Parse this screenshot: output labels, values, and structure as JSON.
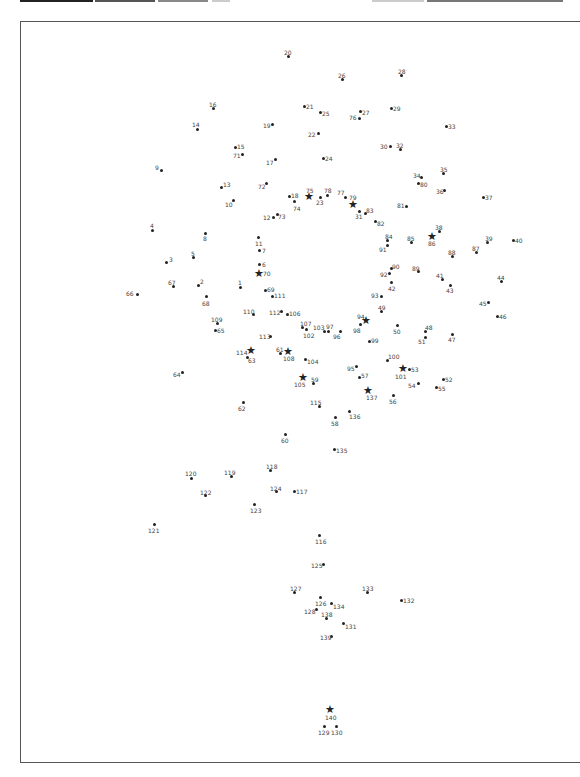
{
  "topbar": {
    "segments": [
      {
        "x": 20,
        "w": 73,
        "color": "#222222"
      },
      {
        "x": 95,
        "w": 60,
        "color": "#555555"
      },
      {
        "x": 158,
        "w": 50,
        "color": "#888888"
      },
      {
        "x": 212,
        "w": 18,
        "color": "#cccccc"
      },
      {
        "x": 372,
        "w": 52,
        "color": "#cccccc"
      },
      {
        "x": 427,
        "w": 136,
        "color": "#777777"
      }
    ]
  },
  "puzzle": {
    "type": "dot-to-dot",
    "points": [
      {
        "n": "1",
        "x": 240,
        "y": 287,
        "lx": 238,
        "ly": 279
      },
      {
        "n": "2",
        "x": 198,
        "y": 285,
        "lx": 200,
        "ly": 278
      },
      {
        "n": "3",
        "x": 166,
        "y": 262,
        "lx": 169,
        "ly": 256
      },
      {
        "n": "4",
        "x": 152,
        "y": 230,
        "lx": 150,
        "ly": 222
      },
      {
        "n": "5",
        "x": 193,
        "y": 257,
        "lx": 191,
        "ly": 250
      },
      {
        "n": "6",
        "x": 259,
        "y": 264,
        "lx": 262,
        "ly": 261
      },
      {
        "n": "7",
        "x": 259,
        "y": 250,
        "lx": 262,
        "ly": 247
      },
      {
        "n": "8",
        "x": 205,
        "y": 233,
        "lx": 203,
        "ly": 235
      },
      {
        "n": "9",
        "x": 161,
        "y": 170,
        "lx": 155,
        "ly": 164
      },
      {
        "n": "10",
        "x": 233,
        "y": 200,
        "lx": 225,
        "ly": 201
      },
      {
        "n": "11",
        "x": 258,
        "y": 237,
        "lx": 255,
        "ly": 240
      },
      {
        "n": "12",
        "x": 273,
        "y": 217,
        "lx": 263,
        "ly": 214
      },
      {
        "n": "13",
        "x": 221,
        "y": 187,
        "lx": 223,
        "ly": 181
      },
      {
        "n": "14",
        "x": 197,
        "y": 129,
        "lx": 192,
        "ly": 121
      },
      {
        "n": "15",
        "x": 235,
        "y": 147,
        "lx": 237,
        "ly": 143
      },
      {
        "n": "16",
        "x": 213,
        "y": 108,
        "lx": 209,
        "ly": 101
      },
      {
        "n": "17",
        "x": 275,
        "y": 159,
        "lx": 266,
        "ly": 159
      },
      {
        "n": "18",
        "x": 289,
        "y": 196,
        "lx": 291,
        "ly": 192
      },
      {
        "n": "19",
        "x": 272,
        "y": 124,
        "lx": 263,
        "ly": 122
      },
      {
        "n": "20",
        "x": 288,
        "y": 56,
        "lx": 284,
        "ly": 49
      },
      {
        "n": "21",
        "x": 304,
        "y": 106,
        "lx": 306,
        "ly": 103
      },
      {
        "n": "22",
        "x": 318,
        "y": 133,
        "lx": 308,
        "ly": 131
      },
      {
        "n": "23",
        "x": 320,
        "y": 197,
        "lx": 316,
        "ly": 199
      },
      {
        "n": "24",
        "x": 323,
        "y": 158,
        "lx": 325,
        "ly": 155
      },
      {
        "n": "25",
        "x": 320,
        "y": 112,
        "lx": 322,
        "ly": 110
      },
      {
        "n": "26",
        "x": 342,
        "y": 79,
        "lx": 338,
        "ly": 72
      },
      {
        "n": "27",
        "x": 360,
        "y": 111,
        "lx": 362,
        "ly": 109
      },
      {
        "n": "28",
        "x": 401,
        "y": 75,
        "lx": 398,
        "ly": 68
      },
      {
        "n": "29",
        "x": 391,
        "y": 108,
        "lx": 393,
        "ly": 105
      },
      {
        "n": "30",
        "x": 390,
        "y": 146,
        "lx": 380,
        "ly": 143
      },
      {
        "n": "31",
        "x": 359,
        "y": 211,
        "lx": 355,
        "ly": 213
      },
      {
        "n": "32",
        "x": 400,
        "y": 149,
        "lx": 396,
        "ly": 142
      },
      {
        "n": "33",
        "x": 446,
        "y": 126,
        "lx": 448,
        "ly": 123
      },
      {
        "n": "34",
        "x": 421,
        "y": 177,
        "lx": 413,
        "ly": 172
      },
      {
        "n": "35",
        "x": 443,
        "y": 173,
        "lx": 440,
        "ly": 166
      },
      {
        "n": "36",
        "x": 444,
        "y": 190,
        "lx": 436,
        "ly": 188
      },
      {
        "n": "37",
        "x": 483,
        "y": 197,
        "lx": 485,
        "ly": 194
      },
      {
        "n": "38",
        "x": 439,
        "y": 231,
        "lx": 435,
        "ly": 224
      },
      {
        "n": "39",
        "x": 487,
        "y": 242,
        "lx": 485,
        "ly": 235
      },
      {
        "n": "40",
        "x": 513,
        "y": 240,
        "lx": 515,
        "ly": 237
      },
      {
        "n": "41",
        "x": 442,
        "y": 279,
        "lx": 436,
        "ly": 272
      },
      {
        "n": "42",
        "x": 391,
        "y": 282,
        "lx": 388,
        "ly": 285
      },
      {
        "n": "43",
        "x": 450,
        "y": 285,
        "lx": 446,
        "ly": 287
      },
      {
        "n": "44",
        "x": 501,
        "y": 281,
        "lx": 497,
        "ly": 274
      },
      {
        "n": "45",
        "x": 488,
        "y": 302,
        "lx": 479,
        "ly": 300
      },
      {
        "n": "46",
        "x": 497,
        "y": 316,
        "lx": 499,
        "ly": 313
      },
      {
        "n": "47",
        "x": 452,
        "y": 334,
        "lx": 448,
        "ly": 336
      },
      {
        "n": "48",
        "x": 425,
        "y": 331,
        "lx": 425,
        "ly": 324
      },
      {
        "n": "49",
        "x": 381,
        "y": 311,
        "lx": 378,
        "ly": 304
      },
      {
        "n": "50",
        "x": 397,
        "y": 325,
        "lx": 393,
        "ly": 328
      },
      {
        "n": "51",
        "x": 425,
        "y": 337,
        "lx": 418,
        "ly": 338
      },
      {
        "n": "52",
        "x": 443,
        "y": 379,
        "lx": 445,
        "ly": 376
      },
      {
        "n": "53",
        "x": 409,
        "y": 369,
        "lx": 411,
        "ly": 366
      },
      {
        "n": "54",
        "x": 418,
        "y": 383,
        "lx": 408,
        "ly": 382
      },
      {
        "n": "55",
        "x": 436,
        "y": 387,
        "lx": 438,
        "ly": 385
      },
      {
        "n": "56",
        "x": 393,
        "y": 395,
        "lx": 389,
        "ly": 398
      },
      {
        "n": "57",
        "x": 359,
        "y": 377,
        "lx": 361,
        "ly": 372
      },
      {
        "n": "58",
        "x": 335,
        "y": 417,
        "lx": 331,
        "ly": 420
      },
      {
        "n": "59",
        "x": 313,
        "y": 383,
        "lx": 311,
        "ly": 376
      },
      {
        "n": "60",
        "x": 285,
        "y": 434,
        "lx": 281,
        "ly": 437
      },
      {
        "n": "61",
        "x": 280,
        "y": 353,
        "lx": 276,
        "ly": 346
      },
      {
        "n": "62",
        "x": 243,
        "y": 402,
        "lx": 238,
        "ly": 405
      },
      {
        "n": "63",
        "x": 247,
        "y": 357,
        "lx": 248,
        "ly": 357
      },
      {
        "n": "64",
        "x": 182,
        "y": 372,
        "lx": 173,
        "ly": 371
      },
      {
        "n": "65",
        "x": 215,
        "y": 330,
        "lx": 217,
        "ly": 327
      },
      {
        "n": "66",
        "x": 137,
        "y": 294,
        "lx": 126,
        "ly": 290
      },
      {
        "n": "67",
        "x": 173,
        "y": 286,
        "lx": 168,
        "ly": 279
      },
      {
        "n": "68",
        "x": 206,
        "y": 296,
        "lx": 202,
        "ly": 300
      },
      {
        "n": "69",
        "x": 265,
        "y": 290,
        "lx": 267,
        "ly": 286
      },
      {
        "n": "70",
        "x": 259,
        "y": 273,
        "lx": 263,
        "ly": 270,
        "star": true
      },
      {
        "n": "71",
        "x": 242,
        "y": 154,
        "lx": 233,
        "ly": 152
      },
      {
        "n": "72",
        "x": 266,
        "y": 183,
        "lx": 258,
        "ly": 183
      },
      {
        "n": "73",
        "x": 277,
        "y": 214,
        "lx": 278,
        "ly": 213
      },
      {
        "n": "74",
        "x": 294,
        "y": 201,
        "lx": 293,
        "ly": 205
      },
      {
        "n": "75",
        "x": 309,
        "y": 196,
        "lx": 306,
        "ly": 187,
        "star": true
      },
      {
        "n": "76",
        "x": 359,
        "y": 118,
        "lx": 349,
        "ly": 114
      },
      {
        "n": "77",
        "x": 345,
        "y": 197,
        "lx": 337,
        "ly": 189
      },
      {
        "n": "78",
        "x": 327,
        "y": 195,
        "lx": 324,
        "ly": 187
      },
      {
        "n": "79",
        "x": 353,
        "y": 204,
        "lx": 349,
        "ly": 194,
        "star": true
      },
      {
        "n": "80",
        "x": 418,
        "y": 183,
        "lx": 420,
        "ly": 181
      },
      {
        "n": "81",
        "x": 406,
        "y": 206,
        "lx": 397,
        "ly": 202
      },
      {
        "n": "82",
        "x": 375,
        "y": 221,
        "lx": 377,
        "ly": 220
      },
      {
        "n": "83",
        "x": 365,
        "y": 213,
        "lx": 366,
        "ly": 207
      },
      {
        "n": "84",
        "x": 387,
        "y": 240,
        "lx": 385,
        "ly": 233
      },
      {
        "n": "85",
        "x": 411,
        "y": 242,
        "lx": 407,
        "ly": 235
      },
      {
        "n": "86",
        "x": 432,
        "y": 236,
        "lx": 428,
        "ly": 240,
        "star": true
      },
      {
        "n": "87",
        "x": 476,
        "y": 252,
        "lx": 472,
        "ly": 245
      },
      {
        "n": "88",
        "x": 452,
        "y": 256,
        "lx": 448,
        "ly": 249
      },
      {
        "n": "89",
        "x": 418,
        "y": 271,
        "lx": 412,
        "ly": 265
      },
      {
        "n": "90",
        "x": 391,
        "y": 268,
        "lx": 392,
        "ly": 263
      },
      {
        "n": "91",
        "x": 387,
        "y": 245,
        "lx": 379,
        "ly": 246
      },
      {
        "n": "92",
        "x": 389,
        "y": 273,
        "lx": 380,
        "ly": 271
      },
      {
        "n": "93",
        "x": 381,
        "y": 296,
        "lx": 371,
        "ly": 292
      },
      {
        "n": "94",
        "x": 366,
        "y": 320,
        "lx": 357,
        "ly": 313,
        "star": true
      },
      {
        "n": "95",
        "x": 356,
        "y": 366,
        "lx": 347,
        "ly": 365
      },
      {
        "n": "96",
        "x": 340,
        "y": 331,
        "lx": 333,
        "ly": 333
      },
      {
        "n": "97",
        "x": 328,
        "y": 331,
        "lx": 326,
        "ly": 323
      },
      {
        "n": "98",
        "x": 360,
        "y": 324,
        "lx": 353,
        "ly": 327
      },
      {
        "n": "99",
        "x": 369,
        "y": 341,
        "lx": 371,
        "ly": 337
      },
      {
        "n": "100",
        "x": 387,
        "y": 360,
        "lx": 388,
        "ly": 353
      },
      {
        "n": "101",
        "x": 403,
        "y": 368,
        "lx": 395,
        "ly": 373,
        "star": true
      },
      {
        "n": "102",
        "x": 306,
        "y": 329,
        "lx": 303,
        "ly": 332
      },
      {
        "n": "103",
        "x": 324,
        "y": 331,
        "lx": 313,
        "ly": 324
      },
      {
        "n": "104",
        "x": 305,
        "y": 359,
        "lx": 307,
        "ly": 358
      },
      {
        "n": "105",
        "x": 303,
        "y": 377,
        "lx": 294,
        "ly": 381,
        "star": true
      },
      {
        "n": "106",
        "x": 287,
        "y": 314,
        "lx": 289,
        "ly": 310
      },
      {
        "n": "107",
        "x": 302,
        "y": 327,
        "lx": 300,
        "ly": 320
      },
      {
        "n": "108",
        "x": 288,
        "y": 351,
        "lx": 283,
        "ly": 355,
        "star": true
      },
      {
        "n": "109",
        "x": 217,
        "y": 323,
        "lx": 211,
        "ly": 316
      },
      {
        "n": "110",
        "x": 253,
        "y": 314,
        "lx": 243,
        "ly": 308
      },
      {
        "n": "111",
        "x": 272,
        "y": 296,
        "lx": 274,
        "ly": 292
      },
      {
        "n": "112",
        "x": 281,
        "y": 311,
        "lx": 269,
        "ly": 309
      },
      {
        "n": "113",
        "x": 270,
        "y": 336,
        "lx": 259,
        "ly": 333
      },
      {
        "n": "114",
        "x": 251,
        "y": 350,
        "lx": 236,
        "ly": 349,
        "star": true
      },
      {
        "n": "115",
        "x": 319,
        "y": 406,
        "lx": 310,
        "ly": 399
      },
      {
        "n": "116",
        "x": 319,
        "y": 535,
        "lx": 315,
        "ly": 538
      },
      {
        "n": "117",
        "x": 294,
        "y": 491,
        "lx": 296,
        "ly": 488
      },
      {
        "n": "118",
        "x": 270,
        "y": 470,
        "lx": 266,
        "ly": 463
      },
      {
        "n": "119",
        "x": 231,
        "y": 476,
        "lx": 224,
        "ly": 469
      },
      {
        "n": "120",
        "x": 191,
        "y": 478,
        "lx": 185,
        "ly": 470
      },
      {
        "n": "121",
        "x": 154,
        "y": 524,
        "lx": 148,
        "ly": 527
      },
      {
        "n": "122",
        "x": 205,
        "y": 495,
        "lx": 200,
        "ly": 489
      },
      {
        "n": "123",
        "x": 254,
        "y": 504,
        "lx": 250,
        "ly": 507
      },
      {
        "n": "124",
        "x": 276,
        "y": 491,
        "lx": 270,
        "ly": 485
      },
      {
        "n": "125",
        "x": 323,
        "y": 564,
        "lx": 311,
        "ly": 562
      },
      {
        "n": "126",
        "x": 320,
        "y": 597,
        "lx": 315,
        "ly": 600
      },
      {
        "n": "127",
        "x": 294,
        "y": 592,
        "lx": 290,
        "ly": 585
      },
      {
        "n": "128",
        "x": 316,
        "y": 609,
        "lx": 304,
        "ly": 608
      },
      {
        "n": "129",
        "x": 324,
        "y": 726,
        "lx": 318,
        "ly": 729
      },
      {
        "n": "130",
        "x": 336,
        "y": 726,
        "lx": 331,
        "ly": 729
      },
      {
        "n": "131",
        "x": 343,
        "y": 623,
        "lx": 345,
        "ly": 623
      },
      {
        "n": "132",
        "x": 401,
        "y": 600,
        "lx": 403,
        "ly": 597
      },
      {
        "n": "133",
        "x": 367,
        "y": 592,
        "lx": 362,
        "ly": 585
      },
      {
        "n": "134",
        "x": 331,
        "y": 603,
        "lx": 333,
        "ly": 603
      },
      {
        "n": "135",
        "x": 334,
        "y": 449,
        "lx": 336,
        "ly": 447
      },
      {
        "n": "136",
        "x": 349,
        "y": 411,
        "lx": 349,
        "ly": 413
      },
      {
        "n": "137",
        "x": 368,
        "y": 390,
        "lx": 366,
        "ly": 394,
        "star": true
      },
      {
        "n": "138",
        "x": 326,
        "y": 618,
        "lx": 321,
        "ly": 611
      },
      {
        "n": "139",
        "x": 331,
        "y": 636,
        "lx": 320,
        "ly": 634
      },
      {
        "n": "140",
        "x": 330,
        "y": 709,
        "lx": 325,
        "ly": 714,
        "star": true
      }
    ]
  }
}
